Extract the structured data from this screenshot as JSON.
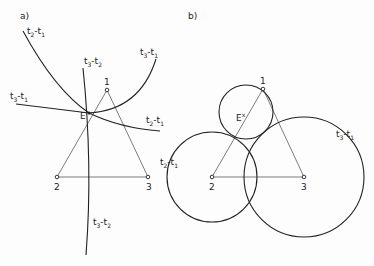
{
  "panels": {
    "a": {
      "label": "a)",
      "points": [
        {
          "id": "1",
          "label": "1",
          "x": 107,
          "y": 90
        },
        {
          "id": "2",
          "label": "2",
          "x": 57,
          "y": 177
        },
        {
          "id": "3",
          "label": "3",
          "x": 148,
          "y": 177
        }
      ],
      "emitter_label": "E",
      "curve_labels": {
        "t2_t1_top": {
          "main": "t",
          "s1": "2",
          "mid": "-t",
          "s2": "1"
        },
        "t3_t1_right": {
          "main": "t",
          "s1": "3",
          "mid": "-t",
          "s2": "1"
        },
        "t3_t2_top": {
          "main": "t",
          "s1": "3",
          "mid": "-t",
          "s2": "2"
        },
        "t3_t1_left": {
          "main": "t",
          "s1": "3",
          "mid": "-t",
          "s2": "1"
        },
        "t2_t1_right": {
          "main": "t",
          "s1": "2",
          "mid": "-t",
          "s2": "1"
        },
        "t3_t2_bottom": {
          "main": "t",
          "s1": "3",
          "mid": "-t",
          "s2": "2"
        }
      }
    },
    "b": {
      "label": "b)",
      "points": [
        {
          "id": "1",
          "label": "1",
          "x": 263,
          "y": 89
        },
        {
          "id": "2",
          "label": "2",
          "x": 212,
          "y": 177
        },
        {
          "id": "3",
          "label": "3",
          "x": 304,
          "y": 177
        }
      ],
      "emitter_label": "E",
      "emitter_mark": "x",
      "circles": [
        {
          "center": "E",
          "cx": 246,
          "cy": 112,
          "r": 27
        },
        {
          "center": "2",
          "cx": 212,
          "cy": 177,
          "r": 45,
          "label": {
            "main": "t",
            "s1": "2",
            "mid": "-t",
            "s2": "1"
          }
        },
        {
          "center": "3",
          "cx": 304,
          "cy": 177,
          "r": 60,
          "label": {
            "main": "t",
            "s1": "3",
            "mid": "-t",
            "s2": "1"
          }
        }
      ]
    }
  }
}
